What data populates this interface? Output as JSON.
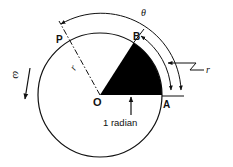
{
  "diagram": {
    "labels": {
      "center": "O",
      "point_a": "A",
      "point_b": "B",
      "point_p": "P",
      "radius_symbol": "r",
      "arc_symbol_r": "r",
      "angle_symbol": "θ",
      "angular_velocity": "ω",
      "sector_label": "1 radian"
    },
    "colors": {
      "stroke": "#111111",
      "sector_fill": "#000000",
      "background": "#ffffff"
    }
  }
}
